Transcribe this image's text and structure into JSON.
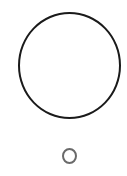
{
  "shapes": [
    {
      "name": "large-circle",
      "type": "circle",
      "center": [
        69.5,
        65.5
      ],
      "diameter": 104,
      "stroke": "#1a1a1a",
      "fill": "#ffffff"
    },
    {
      "name": "small-circle",
      "type": "circle",
      "center": [
        69.5,
        156
      ],
      "diameter": 15,
      "stroke": "#6a6a6a",
      "fill": "#ffffff"
    }
  ],
  "colors": {
    "background": "#ffffff",
    "large_stroke": "#1a1a1a",
    "small_stroke": "#6a6a6a"
  }
}
